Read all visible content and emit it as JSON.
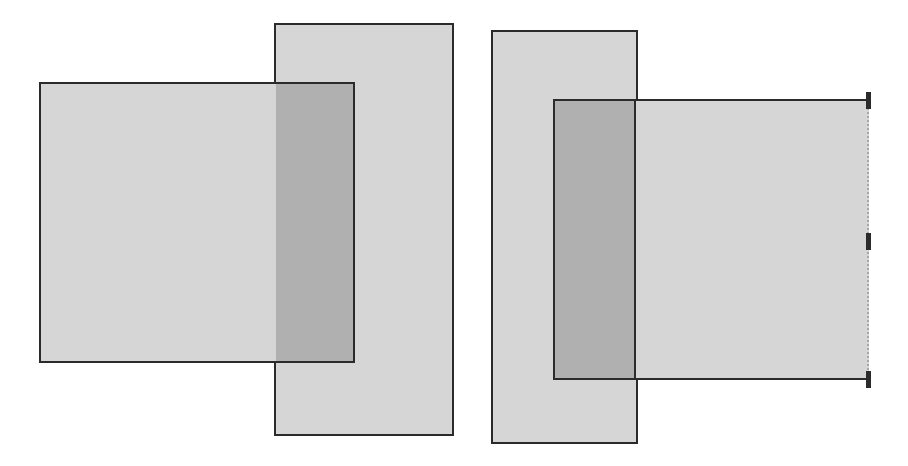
{
  "diagram": {
    "colors": {
      "fill": "#d6d6d6",
      "overlap_fill": "#b0b0b0",
      "border": "#2b2b2b",
      "background": "#ffffff"
    },
    "left_group": {
      "tall_rect": {
        "x": 274,
        "y": 23,
        "w": 180,
        "h": 413
      },
      "square": {
        "x": 39,
        "y": 82,
        "w": 316,
        "h": 281
      },
      "overlap": {
        "x": 276,
        "y": 84,
        "w": 77,
        "h": 277
      }
    },
    "right_group": {
      "tall_rect": {
        "x": 491,
        "y": 30,
        "w": 147,
        "h": 414
      },
      "square": {
        "x": 553,
        "y": 99,
        "w": 316,
        "h": 281,
        "right_edge": "dashed"
      },
      "overlap": {
        "x": 555,
        "y": 101,
        "w": 81,
        "h": 277
      },
      "handles": [
        {
          "x": 866,
          "y": 92
        },
        {
          "x": 866,
          "y": 233
        },
        {
          "x": 866,
          "y": 371
        }
      ]
    }
  }
}
